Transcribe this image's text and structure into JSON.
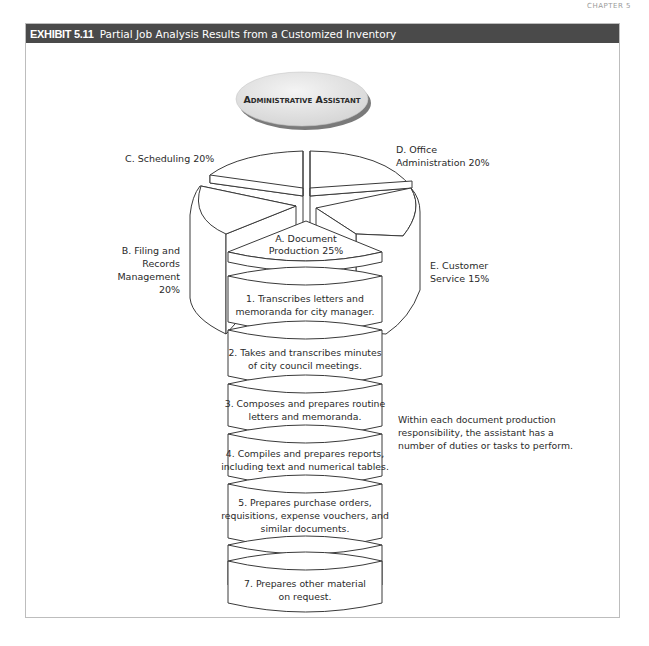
{
  "page": {
    "chapter_label": "CHAPTER 5"
  },
  "exhibit": {
    "number": "EXHIBIT 5.11",
    "title": "Partial Job Analysis Results from a Customized Inventory",
    "bar_color": "#4a4a4a"
  },
  "diagram": {
    "root": {
      "label": "Administrative Assistant"
    },
    "segments": [
      {
        "id": "A",
        "label_line1": "A. Document",
        "label_line2": "Production 25%",
        "name": "Document Production",
        "percent": 25
      },
      {
        "id": "B",
        "label_lines": [
          "B. Filing and",
          "Records",
          "Management",
          "20%"
        ],
        "name": "Filing and Records Management",
        "percent": 20
      },
      {
        "id": "C",
        "label": "C. Scheduling 20%",
        "name": "Scheduling",
        "percent": 20
      },
      {
        "id": "D",
        "label_line1": "D. Office",
        "label_line2": "Administration 20%",
        "name": "Office Administration",
        "percent": 20
      },
      {
        "id": "E",
        "label_line1": "E. Customer",
        "label_line2": "Service 15%",
        "name": "Customer Service",
        "percent": 15
      }
    ],
    "tasks": [
      {
        "line1": "1. Transcribes letters and",
        "line2": "memoranda for city manager."
      },
      {
        "line1": "2. Takes and transcribes minutes",
        "line2": "of city council meetings."
      },
      {
        "line1": "3. Composes and prepares routine",
        "line2": "letters and memoranda."
      },
      {
        "line1": "4. Compiles and prepares reports,",
        "line2": "including text and numerical tables."
      },
      {
        "line1": "5. Prepares purchase orders,",
        "line2": "requisitions, expense vouchers, and",
        "line3": "similar documents."
      },
      {
        "line1": "6. Prepares proclamations, press",
        "line2": "releases, and similar material."
      },
      {
        "line1": "7. Prepares other material",
        "line2": "on request."
      }
    ],
    "note": "Within each document production responsibility, the assistant has a number of duties or tasks to perform."
  }
}
